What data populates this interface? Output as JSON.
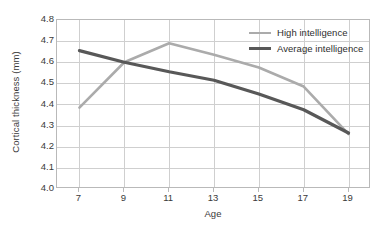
{
  "chart_data": {
    "type": "line",
    "title": "",
    "xlabel": "Age",
    "ylabel": "Cortical thickness (mm)",
    "x": [
      7,
      9,
      11,
      13,
      15,
      17,
      19
    ],
    "xtick_labels": [
      "7",
      "9",
      "11",
      "13",
      "15",
      "17",
      "19"
    ],
    "ytick_labels": [
      "4.8",
      "4.7",
      "4.6",
      "4.5",
      "4.4",
      "4.3",
      "4.2",
      "4.1",
      "4.0"
    ],
    "ytick_values": [
      4.8,
      4.7,
      4.6,
      4.5,
      4.4,
      4.3,
      4.2,
      4.1,
      4.0
    ],
    "xlim": [
      6,
      20
    ],
    "ylim": [
      4.0,
      4.8
    ],
    "grid": true,
    "legend_position": "top-right",
    "series": [
      {
        "name": "High intelligence",
        "color": "#ababab",
        "line_width": 2.6,
        "values": [
          4.385,
          4.6,
          4.69,
          4.635,
          4.575,
          4.485,
          4.26
        ]
      },
      {
        "name": "Average intelligence",
        "color": "#585858",
        "line_width": 3.2,
        "values": [
          4.655,
          4.6,
          4.555,
          4.515,
          4.45,
          4.375,
          4.265
        ]
      }
    ]
  },
  "legend": {
    "entries": [
      {
        "label": "High intelligence"
      },
      {
        "label": "Average intelligence"
      }
    ]
  },
  "axes": {
    "y_title": "Cortical thickness (mm)",
    "x_title": "Age"
  }
}
